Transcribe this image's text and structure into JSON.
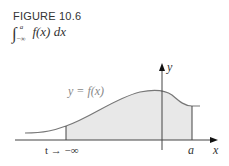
{
  "figure": {
    "label": "FIGURE 10.6",
    "integral": {
      "sign": "∫",
      "lower": "−∞",
      "upper": "a",
      "integrand": "f(x) dx"
    }
  },
  "plot": {
    "curve_label": "y = f(x)",
    "x_axis_label": "x",
    "y_axis_label": "y",
    "a_label": "a",
    "t_label": "t → −∞",
    "fill_color": "#e8e8e8",
    "curve_color": "#777777"
  }
}
